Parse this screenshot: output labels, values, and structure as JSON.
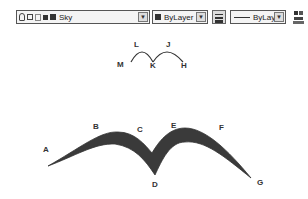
{
  "toolbar": {
    "layer_dropdown": {
      "value": "Sky",
      "icons": [
        "lightbulb-icon",
        "sun-icon",
        "freeze-icon",
        "lock-icon",
        "color-swatch-icon"
      ]
    },
    "color_dropdown": {
      "value": "ByLayer"
    },
    "lineweight_button": {
      "icon": "lineweight-icon"
    },
    "linetype_dropdown": {
      "value": "ByLayer"
    },
    "properties_button": {
      "icon": "properties-icon"
    }
  },
  "diagram": {
    "arc_labels": {
      "M": "M",
      "L": "L",
      "K": "K",
      "J": "J",
      "H": "H"
    },
    "wing_labels": {
      "A": "A",
      "B": "B",
      "C": "C",
      "D": "D",
      "E": "E",
      "F": "F",
      "G": "G"
    },
    "stroke_color": "#333333",
    "fill_color": "#3a3a3a"
  }
}
